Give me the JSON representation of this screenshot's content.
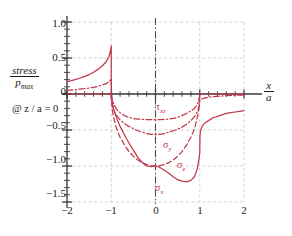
{
  "chart_data": {
    "type": "line",
    "title": "",
    "ylabel_numerator": "stress",
    "ylabel_denominator": "p",
    "ylabel_denominator_sub": "max",
    "condition": "@ z / a = 0",
    "xlabel_numerator": "x",
    "xlabel_denominator": "a",
    "xlim": [
      -2,
      2
    ],
    "ylim": [
      -1.5,
      1.0
    ],
    "xticks": [
      -2,
      -1,
      0,
      1,
      2
    ],
    "xticklabels": [
      "−2",
      "−1",
      "0",
      "1",
      "2"
    ],
    "yticks": [
      1.0,
      0.5,
      0,
      -0.5,
      -1.0,
      -1.5
    ],
    "yticklabels": [
      "1.0",
      "0.5",
      "0",
      "−0.5",
      "−1.0",
      "−1.5"
    ],
    "minor_tick_step": 0.2,
    "grid": true,
    "grid_style": "dashed",
    "centerline_x": 0,
    "accent_color": "#c0374a",
    "grid_color": "#c8c8c8",
    "axis_color": "#3a3a3a",
    "legend": "inline-annotations",
    "series": [
      {
        "name": "sigma_x",
        "label": "σ",
        "label_sub": "x",
        "style": "solid",
        "label_pos": {
          "x": 0.12,
          "y": -1.32
        },
        "points": [
          [
            -2.0,
            0.172
          ],
          [
            -1.9,
            0.186
          ],
          [
            -1.8,
            0.203
          ],
          [
            -1.7,
            0.222
          ],
          [
            -1.6,
            0.244
          ],
          [
            -1.5,
            0.27
          ],
          [
            -1.4,
            0.302
          ],
          [
            -1.3,
            0.342
          ],
          [
            -1.2,
            0.392
          ],
          [
            -1.12,
            0.444
          ],
          [
            -1.06,
            0.508
          ],
          [
            -1.02,
            0.586
          ],
          [
            -1.005,
            0.65
          ],
          [
            -1.0,
            0.67
          ],
          [
            -0.999,
            0.17
          ],
          [
            -0.99,
            -0.06
          ],
          [
            -0.97,
            -0.14
          ],
          [
            -0.95,
            -0.2
          ],
          [
            -0.9,
            -0.3
          ],
          [
            -0.85,
            -0.38
          ],
          [
            -0.8,
            -0.45
          ],
          [
            -0.7,
            -0.57
          ],
          [
            -0.6,
            -0.68
          ],
          [
            -0.5,
            -0.78
          ],
          [
            -0.4,
            -0.88
          ],
          [
            -0.3,
            -0.95
          ],
          [
            -0.2,
            -1.0
          ],
          [
            -0.1,
            -1.01
          ],
          [
            0.0,
            -1.0
          ],
          [
            0.1,
            -1.02
          ],
          [
            0.2,
            -1.06
          ],
          [
            0.3,
            -1.1
          ],
          [
            0.4,
            -1.15
          ],
          [
            0.5,
            -1.19
          ],
          [
            0.6,
            -1.21
          ],
          [
            0.7,
            -1.22
          ],
          [
            0.8,
            -1.2
          ],
          [
            0.88,
            -1.15
          ],
          [
            0.94,
            -1.05
          ],
          [
            0.98,
            -0.92
          ],
          [
            1.0,
            -0.82
          ],
          [
            1.005,
            -0.58
          ],
          [
            1.02,
            -0.5
          ],
          [
            1.06,
            -0.44
          ],
          [
            1.12,
            -0.4
          ],
          [
            1.2,
            -0.37
          ],
          [
            1.3,
            -0.33
          ],
          [
            1.4,
            -0.31
          ],
          [
            1.5,
            -0.29
          ],
          [
            1.6,
            -0.27
          ],
          [
            1.7,
            -0.26
          ],
          [
            1.8,
            -0.25
          ],
          [
            1.9,
            -0.24
          ],
          [
            2.0,
            -0.23
          ]
        ]
      },
      {
        "name": "sigma_z",
        "label": "σ",
        "label_sub": "z",
        "style": "dashed",
        "label_pos": {
          "x": 0.4,
          "y": -1.03
        },
        "points": [
          [
            -1.0,
            0.0
          ],
          [
            -0.98,
            -0.2
          ],
          [
            -0.95,
            -0.32
          ],
          [
            -0.9,
            -0.44
          ],
          [
            -0.85,
            -0.53
          ],
          [
            -0.8,
            -0.6
          ],
          [
            -0.7,
            -0.71
          ],
          [
            -0.6,
            -0.8
          ],
          [
            -0.5,
            -0.866
          ],
          [
            -0.4,
            -0.917
          ],
          [
            -0.3,
            -0.954
          ],
          [
            -0.2,
            -0.98
          ],
          [
            -0.1,
            -0.995
          ],
          [
            0.0,
            -1.0
          ],
          [
            0.1,
            -0.995
          ],
          [
            0.2,
            -0.98
          ],
          [
            0.3,
            -0.954
          ],
          [
            0.4,
            -0.917
          ],
          [
            0.5,
            -0.866
          ],
          [
            0.6,
            -0.8
          ],
          [
            0.7,
            -0.71
          ],
          [
            0.8,
            -0.6
          ],
          [
            0.85,
            -0.53
          ],
          [
            0.9,
            -0.44
          ],
          [
            0.95,
            -0.31
          ],
          [
            0.98,
            -0.2
          ],
          [
            1.0,
            0.0
          ]
        ]
      },
      {
        "name": "sigma_y",
        "label": "σ",
        "label_sub": "y",
        "style": "dashdot",
        "label_pos": {
          "x": 0.1,
          "y": -0.8
        },
        "points": [
          [
            -2.0,
            0.052
          ],
          [
            -1.8,
            0.062
          ],
          [
            -1.6,
            0.074
          ],
          [
            -1.4,
            0.092
          ],
          [
            -1.25,
            0.115
          ],
          [
            -1.12,
            0.143
          ],
          [
            -1.04,
            0.178
          ],
          [
            -1.005,
            0.205
          ],
          [
            -1.0,
            0.215
          ],
          [
            -0.998,
            -0.05
          ],
          [
            -0.98,
            -0.14
          ],
          [
            -0.95,
            -0.21
          ],
          [
            -0.9,
            -0.28
          ],
          [
            -0.8,
            -0.36
          ],
          [
            -0.7,
            -0.41
          ],
          [
            -0.6,
            -0.45
          ],
          [
            -0.5,
            -0.48
          ],
          [
            -0.4,
            -0.51
          ],
          [
            -0.3,
            -0.53
          ],
          [
            -0.2,
            -0.55
          ],
          [
            -0.1,
            -0.56
          ],
          [
            0.0,
            -0.565
          ],
          [
            0.1,
            -0.56
          ],
          [
            0.2,
            -0.55
          ],
          [
            0.3,
            -0.53
          ],
          [
            0.4,
            -0.51
          ],
          [
            0.5,
            -0.49
          ],
          [
            0.6,
            -0.46
          ],
          [
            0.7,
            -0.42
          ],
          [
            0.8,
            -0.37
          ],
          [
            0.9,
            -0.3
          ],
          [
            0.96,
            -0.23
          ],
          [
            0.99,
            -0.16
          ],
          [
            1.0,
            -0.1
          ],
          [
            1.005,
            -0.09
          ],
          [
            1.04,
            -0.07
          ],
          [
            1.12,
            -0.055
          ],
          [
            1.25,
            -0.042
          ],
          [
            1.4,
            -0.032
          ],
          [
            1.6,
            -0.024
          ],
          [
            1.8,
            -0.018
          ],
          [
            2.0,
            -0.014
          ]
        ]
      },
      {
        "name": "tau_xz",
        "label": "τ",
        "label_sub": "xz",
        "style": "dashdot",
        "label_pos": {
          "x": -0.05,
          "y": -0.18
        },
        "points": [
          [
            -1.0,
            0.0
          ],
          [
            -0.97,
            -0.1
          ],
          [
            -0.93,
            -0.16
          ],
          [
            -0.88,
            -0.21
          ],
          [
            -0.8,
            -0.26
          ],
          [
            -0.7,
            -0.3
          ],
          [
            -0.6,
            -0.325
          ],
          [
            -0.5,
            -0.34
          ],
          [
            -0.4,
            -0.348
          ],
          [
            -0.3,
            -0.353
          ],
          [
            -0.2,
            -0.356
          ],
          [
            -0.1,
            -0.357
          ],
          [
            0.0,
            -0.357
          ],
          [
            0.1,
            -0.356
          ],
          [
            0.2,
            -0.353
          ],
          [
            0.3,
            -0.348
          ],
          [
            0.4,
            -0.34
          ],
          [
            0.5,
            -0.325
          ],
          [
            0.6,
            -0.3
          ],
          [
            0.7,
            -0.27
          ],
          [
            0.8,
            -0.235
          ],
          [
            0.88,
            -0.2
          ],
          [
            0.94,
            -0.15
          ],
          [
            0.98,
            -0.09
          ],
          [
            1.0,
            0.0
          ]
        ]
      }
    ]
  }
}
